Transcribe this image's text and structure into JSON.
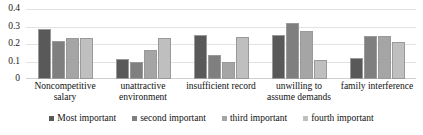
{
  "chart_data": {
    "type": "bar",
    "title": "",
    "xlabel": "",
    "ylabel": "",
    "ylim": [
      0,
      0.4
    ],
    "grid": true,
    "legend_position": "bottom",
    "categories": [
      "Noncompetitive salary",
      "unattractive environment",
      "insufficient record",
      "unwilling to assume demands",
      "family interference"
    ],
    "ytick_labels": [
      "0.4",
      "0.3",
      "0.2",
      "0.1",
      "0"
    ],
    "ytick_values": [
      0.4,
      0.3,
      0.2,
      0.1,
      0
    ],
    "series": [
      {
        "name": "Most important",
        "color": "#595959",
        "values": [
          0.285,
          0.113,
          0.25,
          0.252,
          0.122
        ]
      },
      {
        "name": "second important",
        "color": "#7f7f7f",
        "values": [
          0.215,
          0.1,
          0.14,
          0.322,
          0.246
        ]
      },
      {
        "name": "third important",
        "color": "#a5a5a5",
        "values": [
          0.237,
          0.168,
          0.099,
          0.272,
          0.247
        ]
      },
      {
        "name": "fourth important",
        "color": "#bfbfbf",
        "values": [
          0.236,
          0.237,
          0.24,
          0.109,
          0.212
        ]
      }
    ]
  }
}
